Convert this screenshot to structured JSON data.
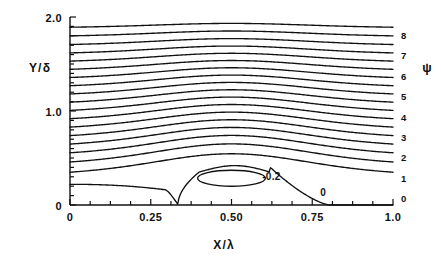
{
  "figure": {
    "background_color": "#ffffff",
    "ink_color": "#111111",
    "axes": {
      "x": {
        "label": "X/λ",
        "tick_labels": [
          "0",
          "0.25",
          "0.50",
          "0.75",
          "1.0"
        ],
        "tick_values": [
          0,
          0.25,
          0.5,
          0.75,
          1.0
        ],
        "range": [
          0,
          1.0
        ],
        "minor_tick_step": 0.0625
      },
      "y": {
        "label": "Y/δ",
        "tick_labels": [
          "0",
          "1.0",
          "2.0"
        ],
        "tick_values": [
          0,
          1.0,
          2.0
        ],
        "range": [
          0,
          2.0
        ]
      }
    },
    "legend": {
      "symbol": "ψ",
      "level_labels": [
        "8",
        "7",
        "6",
        "5",
        "4",
        "3",
        "2",
        "1",
        "0"
      ],
      "level_values": [
        8,
        7,
        6,
        5,
        4,
        3,
        2,
        1,
        0
      ]
    },
    "inline_labels": [
      {
        "text": "-0.2",
        "x": 0.595,
        "y": 0.3
      },
      {
        "text": "0",
        "x": 0.775,
        "y": 0.135
      }
    ]
  },
  "chart_data": {
    "type": "line",
    "title": "",
    "subtitle": "",
    "xlabel": "X/λ",
    "ylabel": "Y/δ",
    "xlim": [
      0,
      1.0
    ],
    "ylim": [
      0,
      2.0
    ],
    "grid": false,
    "legend_position": "right",
    "legend_title": "ψ",
    "x_ticks": [
      0,
      0.25,
      0.5,
      0.75,
      1.0
    ],
    "x_tick_labels": [
      "0",
      "0.25",
      "0.50",
      "0.75",
      "1.0"
    ],
    "y_ticks": [
      0,
      1.0,
      2.0
    ],
    "y_tick_labels": [
      "0",
      "1.0",
      "2.0"
    ],
    "right_axis_ticks": [
      0,
      1,
      2,
      3,
      4,
      5,
      6,
      7,
      8
    ],
    "right_axis_tick_labels": [
      "0",
      "1",
      "2",
      "3",
      "4",
      "5",
      "6",
      "7",
      "8"
    ],
    "annotations": [
      {
        "text": "-0.2",
        "x": 0.595,
        "y": 0.3,
        "note": "closed inner streamline of recirculation bubble"
      },
      {
        "text": "0",
        "x": 0.775,
        "y": 0.135,
        "note": "dividing streamline psi = 0"
      }
    ],
    "series": [
      {
        "name": "ψ = 0 (dividing streamline)",
        "psi": 0.0,
        "y_left": 0.22,
        "bulge": 0.0,
        "closed": false
      },
      {
        "name": "ψ = -0.2 (bubble core)",
        "psi": -0.2,
        "y_left": null,
        "bulge": 0.0,
        "closed": true,
        "center": [
          0.5,
          0.285
        ],
        "rx": 0.105,
        "ry": 0.085
      },
      {
        "name": "ψ = 0.5",
        "psi": 0.5,
        "y_left": 0.295,
        "bulge": 0.25
      },
      {
        "name": "ψ = 1.0",
        "psi": 1.0,
        "y_left": 0.405,
        "bulge": 0.245
      },
      {
        "name": "ψ = 1.5",
        "psi": 1.5,
        "y_left": 0.505,
        "bulge": 0.235
      },
      {
        "name": "ψ = 2.0",
        "psi": 2.0,
        "y_left": 0.6,
        "bulge": 0.225
      },
      {
        "name": "ψ = 2.5",
        "psi": 2.5,
        "y_left": 0.692,
        "bulge": 0.215
      },
      {
        "name": "ψ = 3.0",
        "psi": 3.0,
        "y_left": 0.785,
        "bulge": 0.203
      },
      {
        "name": "ψ = 3.5",
        "psi": 3.5,
        "y_left": 0.877,
        "bulge": 0.192
      },
      {
        "name": "ψ = 4.0",
        "psi": 4.0,
        "y_left": 0.968,
        "bulge": 0.18
      },
      {
        "name": "ψ = 4.5",
        "psi": 4.5,
        "y_left": 1.058,
        "bulge": 0.168
      },
      {
        "name": "ψ = 5.0",
        "psi": 5.0,
        "y_left": 1.148,
        "bulge": 0.156
      },
      {
        "name": "ψ = 5.5",
        "psi": 5.5,
        "y_left": 1.238,
        "bulge": 0.144
      },
      {
        "name": "ψ = 6.0",
        "psi": 6.0,
        "y_left": 1.328,
        "bulge": 0.132
      },
      {
        "name": "ψ = 6.5",
        "psi": 6.5,
        "y_left": 1.418,
        "bulge": 0.119
      },
      {
        "name": "ψ = 7.0",
        "psi": 7.0,
        "y_left": 1.508,
        "bulge": 0.106
      },
      {
        "name": "ψ = 7.5",
        "psi": 7.5,
        "y_left": 1.598,
        "bulge": 0.093
      },
      {
        "name": "ψ = 8.0",
        "psi": 8.0,
        "y_left": 1.69,
        "bulge": 0.08
      },
      {
        "name": "ψ = 8.5",
        "psi": 8.5,
        "y_left": 1.785,
        "bulge": 0.066
      },
      {
        "name": "ψ = 9.0",
        "psi": 9.0,
        "y_left": 1.88,
        "bulge": 0.052
      }
    ]
  }
}
